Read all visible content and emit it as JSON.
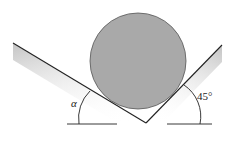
{
  "diagram": {
    "type": "mechanics-free-body",
    "labels": {
      "left_angle": "α",
      "right_angle": "45°"
    },
    "colors": {
      "sphere_fill": "#a9a9a9",
      "line": "#222222",
      "wall_shade": "#c8c8c8",
      "background": "#ffffff"
    },
    "geometry": {
      "left_wall": {
        "x1": 13,
        "y1": 43,
        "x2": 146,
        "y2": 123
      },
      "right_wall": {
        "x1": 146,
        "y1": 123,
        "x2": 222,
        "y2": 45
      },
      "sphere": {
        "cx": 138,
        "cy": 61,
        "r": 48
      },
      "left_baseline": {
        "x1": 67,
        "y1": 124,
        "x2": 117,
        "y2": 124
      },
      "right_baseline": {
        "x1": 167,
        "y1": 124,
        "x2": 212,
        "y2": 124
      }
    }
  }
}
